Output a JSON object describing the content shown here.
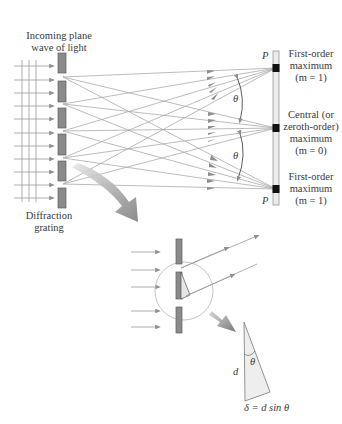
{
  "figure": {
    "title_top": [
      "Incoming plane",
      "wave of light"
    ],
    "grating_label": [
      "Diffraction",
      "grating"
    ],
    "screen_markers": {
      "top": "P",
      "bottom": "P"
    },
    "maxima": [
      {
        "lines": [
          "First-order",
          "maximum",
          "(m = 1)"
        ],
        "order": 1
      },
      {
        "lines": [
          "Central (or",
          "zeroth-order)",
          "maximum",
          "(m = 0)"
        ],
        "order": 0
      },
      {
        "lines": [
          "First-order",
          "maximum",
          "(m = 1)"
        ],
        "order": 1
      }
    ],
    "angle_labels": [
      "θ",
      "θ"
    ],
    "inset": {
      "side_label": "d",
      "angle_label": "θ",
      "equation": "δ = d sin θ"
    }
  },
  "colors": {
    "grating_fill": "#8a8a8a",
    "ray": "#9c9c9c",
    "arrowhead": "#8e8e8e",
    "screen_fill": "#ececec",
    "maximum_mark": "#111111",
    "big_arrow": "#8c8c8c",
    "triangle_fill": "#eeeeee",
    "text": "#3a3a3a"
  }
}
